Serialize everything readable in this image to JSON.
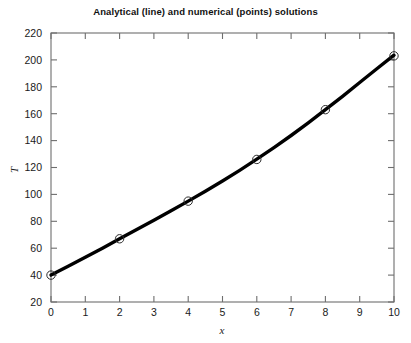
{
  "chart_data": {
    "type": "line",
    "title": "Analytical (line) and numerical (points) solutions",
    "xlabel": "x",
    "ylabel": "T",
    "xlim": [
      0,
      10
    ],
    "ylim": [
      20,
      220
    ],
    "xticks": [
      "0",
      "1",
      "2",
      "3",
      "4",
      "5",
      "6",
      "7",
      "8",
      "9",
      "10"
    ],
    "yticks": [
      "20",
      "40",
      "60",
      "80",
      "100",
      "120",
      "140",
      "160",
      "180",
      "200",
      "220"
    ],
    "xtick_values": [
      0,
      1,
      2,
      3,
      4,
      5,
      6,
      7,
      8,
      9,
      10
    ],
    "ytick_values": [
      20,
      40,
      60,
      80,
      100,
      120,
      140,
      160,
      180,
      200,
      220
    ],
    "grid": false,
    "legend": "none",
    "series": [
      {
        "name": "Analytical (line)",
        "style": "line",
        "color": "#000000",
        "x": [
          0,
          0.5,
          1,
          1.5,
          2,
          2.5,
          3,
          3.5,
          4,
          4.5,
          5,
          5.5,
          6,
          6.5,
          7,
          7.5,
          8,
          8.5,
          9,
          9.5,
          10
        ],
        "values": [
          40,
          46.5,
          53.2,
          60.0,
          67.0,
          73.9,
          80.8,
          87.8,
          95.0,
          102.4,
          110.0,
          117.9,
          126.2,
          134.8,
          143.8,
          153.2,
          163.0,
          172.9,
          183.2,
          193.4,
          203.5
        ]
      },
      {
        "name": "Numerical (points)",
        "style": "markers",
        "marker": "circle-open",
        "color": "#2b2b2b",
        "x": [
          0,
          2,
          4,
          6,
          8,
          10
        ],
        "values": [
          40,
          67,
          95,
          126,
          163,
          203
        ]
      }
    ]
  },
  "axes": {
    "x_axis_title": "x",
    "y_axis_title": "T"
  }
}
